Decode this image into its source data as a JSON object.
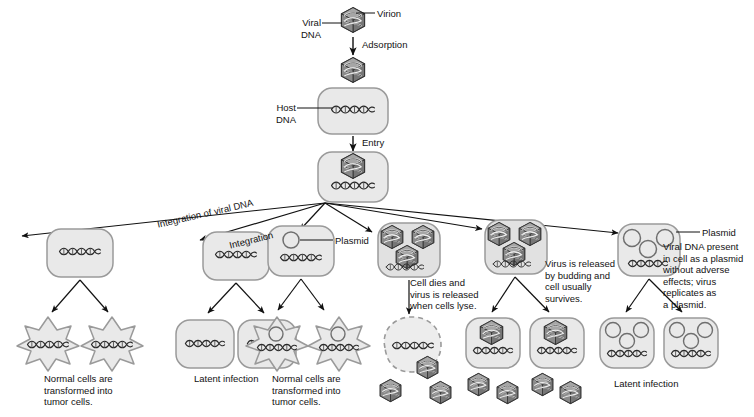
{
  "diagram": {
    "colors": {
      "cell_fill": "#e9e9e9",
      "cell_stroke": "#9a9a9a",
      "virion_fill": "#8d8d8d",
      "virion_stroke": "#3a3a3a",
      "dna_stroke": "#2b2b2b",
      "arrow": "#111111",
      "text": "#121212"
    },
    "top_pathway": {
      "virion_label": "Virion",
      "viral_dna_label": "Viral\nDNA",
      "adsorption_label": "Adsorption",
      "host_dna_label": "Host\nDNA",
      "entry_label": "Entry"
    },
    "branch_labels": {
      "integration_of_viral_dna": "Integration of viral DNA",
      "integration": "Integration"
    },
    "branches": [
      {
        "id": "branch-transformation-left",
        "plasmid_label": null,
        "outcome_text": "Normal cells are\ntransformed into\ntumor cells.",
        "cell_type": "integrated-dna"
      },
      {
        "id": "branch-latent-left",
        "plasmid_label": null,
        "outcome_text": "Latent infection",
        "cell_type": "integrated-dna"
      },
      {
        "id": "branch-plasmid-transformation",
        "plasmid_label": "Plasmid",
        "outcome_text": "Normal cells are\ntransformed into\ntumor cells.",
        "cell_type": "plasmid"
      },
      {
        "id": "branch-lysis",
        "process_text": "Cell dies and\nvirus is released\nwhen cells lyse.",
        "cell_type": "virion-filled"
      },
      {
        "id": "branch-budding",
        "process_text": "Virus is released\nby budding and\ncell usually\nsurvives.",
        "cell_type": "virion-filled"
      },
      {
        "id": "branch-plasmid-latent",
        "plasmid_label": "Plasmid",
        "description_text": "Viral DNA present\nin cell as a plasmid\nwithout adverse\neffects; virus\nreplicates as\na plasmid.",
        "outcome_text": "Latent infection",
        "cell_type": "multi-plasmid"
      }
    ]
  }
}
